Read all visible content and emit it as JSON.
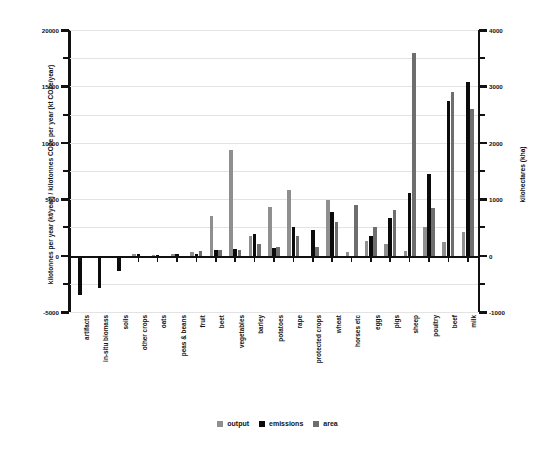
{
  "chart_data": {
    "type": "bar",
    "title": "",
    "xlabel": "",
    "ylabel": "kilotonnes per year (kt/year) / kilotonnes CO2e per year (kt CO2e/year)",
    "y2label": "kilohectares (kha)",
    "ylim": [
      -5000,
      20000
    ],
    "y2lim": [
      -1000,
      4000
    ],
    "yticks": [
      -5000,
      0,
      5000,
      10000,
      15000,
      20000
    ],
    "y2ticks": [
      -1000,
      0,
      1000,
      2000,
      3000,
      4000
    ],
    "minor_gridlines": true,
    "grid": true,
    "legend_position": "bottom",
    "categories": [
      "artifacts",
      "in-situ biomass",
      "soils",
      "other crops",
      "oats",
      "peas & beans",
      "fruit",
      "beet",
      "vegetables",
      "barley",
      "potatoes",
      "rape",
      "protected crops",
      "wheat",
      "horses etc",
      "eggs",
      "pigs",
      "sheep",
      "poultry",
      "beef",
      "milk"
    ],
    "series": [
      {
        "name": "output",
        "color": "#8f8f8f",
        "axis": "left",
        "values": [
          0,
          0,
          0,
          120,
          60,
          150,
          300,
          3550,
          9350,
          1700,
          4300,
          5800,
          0,
          4950,
          300,
          1300,
          1000,
          450,
          2550,
          1250,
          2050
        ]
      },
      {
        "name": "emissions",
        "color": "#0b0b0b",
        "axis": "left",
        "values": [
          -3450,
          -2900,
          -1350,
          110,
          80,
          180,
          120,
          500,
          550,
          1900,
          700,
          2500,
          2250,
          3850,
          0,
          1750,
          3350,
          5550,
          7250,
          13750,
          15400
        ]
      },
      {
        "name": "area",
        "color": "#6e6e6e",
        "axis": "right",
        "values": [
          0,
          0,
          0,
          0,
          0,
          0,
          80,
          100,
          100,
          200,
          150,
          350,
          150,
          600,
          900,
          500,
          800,
          3600,
          850,
          2900,
          2600
        ]
      }
    ],
    "legend": [
      "output",
      "emissions",
      "area"
    ]
  }
}
